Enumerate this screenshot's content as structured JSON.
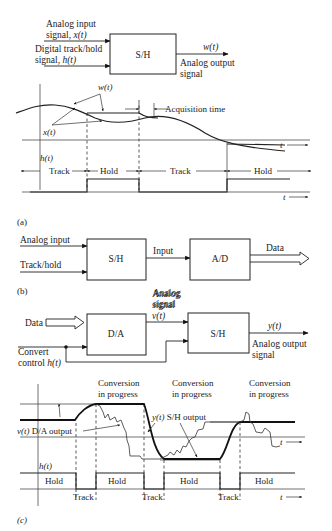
{
  "figure_a": {
    "block": {
      "label": "S/H",
      "input1_line1": "Analog input",
      "input1_line2": "signal, x(t)",
      "input2_line1": "Digital track/hold",
      "input2_line2": "signal, h(t)",
      "output_signal": "w(t)",
      "output_line1": "Analog output",
      "output_line2": "signal"
    },
    "waveform": {
      "w_label": "w(t)",
      "x_label": "x(t)",
      "h_label": "h(t)",
      "acquisition_label": "Acquisition time",
      "t_label": "t",
      "phases": [
        "Track",
        "Hold",
        "Track",
        "Hold"
      ]
    },
    "caption": "(a)"
  },
  "figure_b": {
    "input1": "Analog input",
    "input2": "Track/hold",
    "block1": "S/H",
    "mid_label": "Input",
    "mid_label_below_1": "Analog",
    "mid_label_below_2": "signal",
    "block2": "A/D",
    "output": "Data",
    "caption": "(b)"
  },
  "figure_c": {
    "block": {
      "data_in": "Data",
      "dac": "D/A",
      "analog_line1": "Analog",
      "analog_line2": "signal",
      "analog_var": "v(t)",
      "sh": "S/H",
      "output_var": "y(t)",
      "output_line1": "Analog output",
      "output_line2": "signal",
      "control_line1": "Convert",
      "control_line2": "control h(t)"
    },
    "waveform": {
      "conv1_line1": "Conversion",
      "conv1_line2": "in progress",
      "conv2_line1": "Conversion",
      "conv2_line2": "in progress",
      "conv3_line1": "Conversion",
      "conv3_line2": "in progress",
      "sh_output_label": "y(t) S/H output",
      "da_output_label": "v(t) D/A output",
      "h_label": "h(t)",
      "t_label": "t",
      "hold_labels": [
        "Hold",
        "Hold",
        "Hold",
        "Hold"
      ],
      "track_labels": [
        "Track",
        "Track",
        "Track"
      ]
    },
    "caption": "(c)"
  }
}
